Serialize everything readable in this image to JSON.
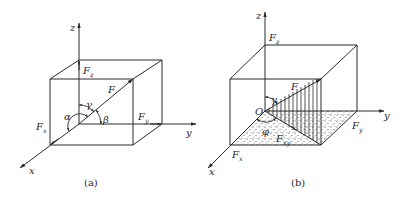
{
  "figures": [
    {
      "id": "a",
      "caption": "(a)",
      "axes": {
        "x": "x",
        "y": "y",
        "z": "z"
      },
      "force": {
        "label": "F"
      },
      "components": [
        {
          "base": "F",
          "sub": "x"
        },
        {
          "base": "F",
          "sub": "y"
        },
        {
          "base": "F",
          "sub": "z"
        }
      ],
      "angles": {
        "alpha": "α",
        "beta": "β",
        "gamma": "γ"
      }
    },
    {
      "id": "b",
      "caption": "(b)",
      "axes": {
        "x": "x",
        "y": "y",
        "z": "z"
      },
      "origin": "O",
      "force": {
        "label": "F"
      },
      "components": [
        {
          "base": "F",
          "sub": "x"
        },
        {
          "base": "F",
          "sub": "y"
        },
        {
          "base": "F",
          "sub": "z"
        }
      ],
      "projection": {
        "base": "F",
        "sub": "xy"
      },
      "angles": {
        "gamma": "γ",
        "phi": "φ"
      }
    }
  ],
  "colors": {
    "ink": "#2a2a2a",
    "background": "#ffffff"
  }
}
